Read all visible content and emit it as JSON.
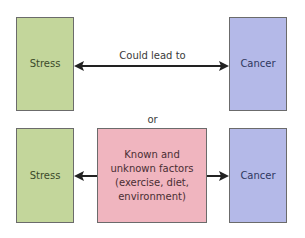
{
  "top_row": {
    "left_box": {
      "label": "Stress",
      "color": "#c3d69b"
    },
    "arrow_label": "Could lead to",
    "right_box": {
      "label": "Cancer",
      "color": "#b4b9e8"
    }
  },
  "separator": "or",
  "bottom_row": {
    "left_box": {
      "label": "Stress",
      "color": "#c3d69b"
    },
    "middle_box": {
      "label": "Known and unknown factors (exercise, diet, environment)",
      "color": "#f0b5bf"
    },
    "right_box": {
      "label": "Cancer",
      "color": "#b4b9e8"
    }
  }
}
